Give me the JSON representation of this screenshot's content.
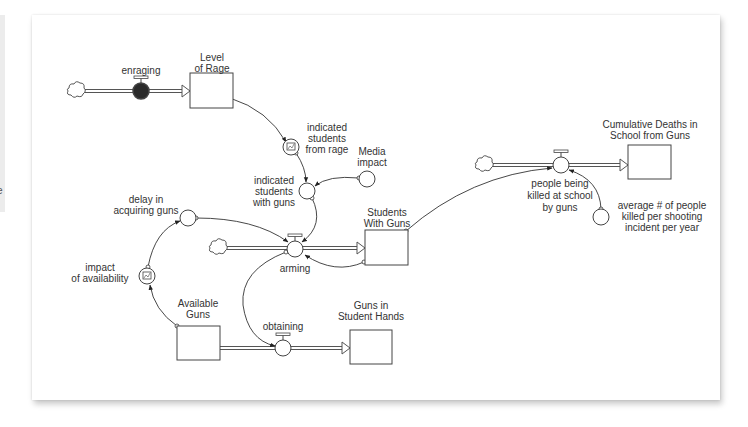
{
  "left_strip": {
    "char": "e"
  },
  "diagram": {
    "stocks": [
      {
        "id": "level_of_rage",
        "label_lines": [
          "Level",
          "of Rage"
        ]
      },
      {
        "id": "students_with_guns",
        "label_lines": [
          "Students",
          "With Guns"
        ]
      },
      {
        "id": "available_guns",
        "label_lines": [
          "Available",
          "Guns"
        ]
      },
      {
        "id": "guns_in_student_hands",
        "label_lines": [
          "Guns in",
          "Student Hands"
        ]
      },
      {
        "id": "cumulative_deaths",
        "label_lines": [
          "Cumulative Deaths in",
          "School from Guns"
        ]
      }
    ],
    "flows": [
      {
        "id": "enraging",
        "label_lines": [
          "enraging"
        ],
        "from": "cloud",
        "to": "level_of_rage"
      },
      {
        "id": "arming",
        "label_lines": [
          "arming"
        ],
        "from": "cloud",
        "to": "students_with_guns"
      },
      {
        "id": "obtaining",
        "label_lines": [
          "obtaining"
        ],
        "from": "available_guns",
        "to": "guns_in_student_hands"
      },
      {
        "id": "people_killed",
        "label_lines": [
          "people being",
          "killed at school",
          "by guns"
        ],
        "from": "cloud",
        "to": "cumulative_deaths"
      }
    ],
    "converters": [
      {
        "id": "indicated_from_rage",
        "label_lines": [
          "indicated",
          "students",
          "from rage"
        ],
        "graphical": true
      },
      {
        "id": "media_impact",
        "label_lines": [
          "Media",
          "impact"
        ]
      },
      {
        "id": "indicated_with_guns",
        "label_lines": [
          "indicated",
          "students",
          "with guns"
        ]
      },
      {
        "id": "delay_acquiring",
        "label_lines": [
          "delay in",
          "acquiring guns"
        ]
      },
      {
        "id": "impact_availability",
        "label_lines": [
          "impact",
          "of availability"
        ],
        "graphical": true
      },
      {
        "id": "avg_killed",
        "label_lines": [
          "average # of people",
          "killed per shooting",
          "incident per year"
        ]
      }
    ],
    "connectors": [
      [
        "level_of_rage",
        "indicated_from_rage"
      ],
      [
        "indicated_from_rage",
        "indicated_with_guns"
      ],
      [
        "media_impact",
        "indicated_with_guns"
      ],
      [
        "indicated_with_guns",
        "arming"
      ],
      [
        "delay_acquiring",
        "arming"
      ],
      [
        "available_guns",
        "impact_availability"
      ],
      [
        "impact_availability",
        "delay_acquiring"
      ],
      [
        "arming",
        "obtaining"
      ],
      [
        "students_with_guns",
        "arming"
      ],
      [
        "students_with_guns",
        "people_killed"
      ],
      [
        "avg_killed",
        "people_killed"
      ]
    ],
    "colors": {
      "line": "#333333",
      "valve_active": "#2a2a2a",
      "pipe": "#555555"
    }
  }
}
